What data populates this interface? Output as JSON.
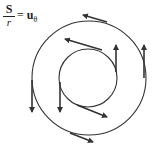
{
  "equation": {
    "numerator": "S",
    "denominator": "r",
    "equals": "=",
    "rhs_symbol": "u",
    "rhs_subscript": "θ"
  },
  "diagram": {
    "colors": {
      "stroke": "#333333",
      "background": "#ffffff"
    },
    "outer_circle": {
      "cx": 89,
      "cy": 78,
      "r": 57
    },
    "inner_circle": {
      "cx": 88,
      "cy": 78,
      "r": 29
    },
    "arrows": [
      {
        "name": "outer-top",
        "x1": 107,
        "y1": 22,
        "x2": 83,
        "y2": 15
      },
      {
        "name": "outer-right",
        "x1": 144,
        "y1": 78,
        "x2": 144,
        "y2": 45
      },
      {
        "name": "outer-left",
        "x1": 32,
        "y1": 80,
        "x2": 32,
        "y2": 112
      },
      {
        "name": "outer-bottom",
        "x1": 70,
        "y1": 133,
        "x2": 93,
        "y2": 142
      },
      {
        "name": "inner-top",
        "x1": 102,
        "y1": 50,
        "x2": 65,
        "y2": 39
      },
      {
        "name": "inner-right",
        "x1": 116,
        "y1": 72,
        "x2": 116,
        "y2": 45
      },
      {
        "name": "inner-left",
        "x1": 60,
        "y1": 82,
        "x2": 60,
        "y2": 112
      },
      {
        "name": "inner-bottom",
        "x1": 77,
        "y1": 105,
        "x2": 107,
        "y2": 117
      }
    ]
  }
}
